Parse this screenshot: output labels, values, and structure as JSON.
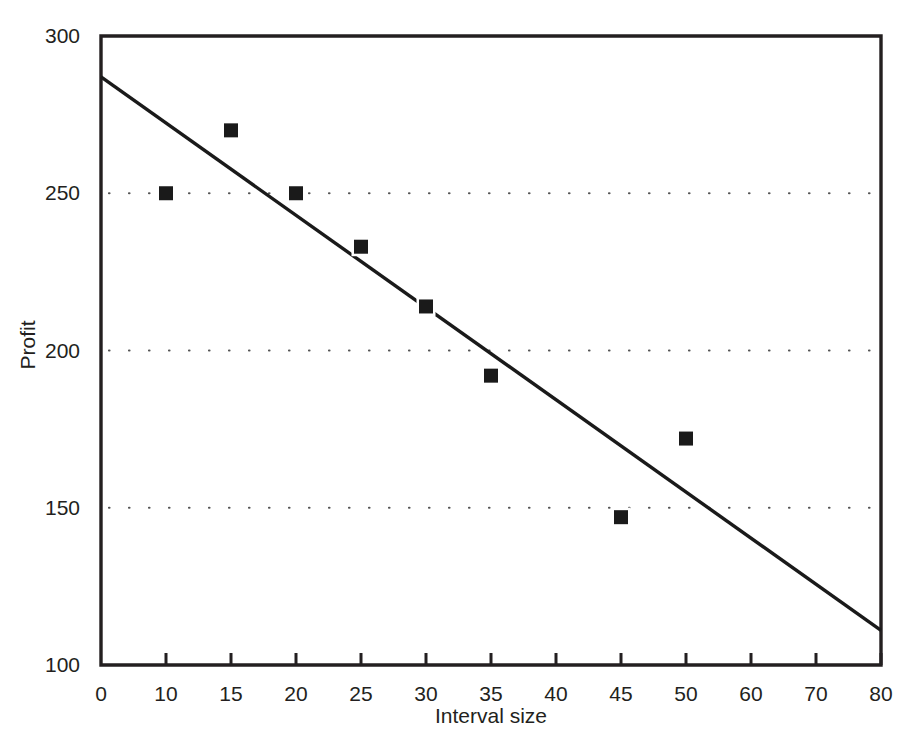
{
  "chart_data": {
    "type": "scatter",
    "title": "",
    "xlabel": "Interval size",
    "ylabel": "Profit",
    "x_tick_labels": [
      "0",
      "10",
      "15",
      "20",
      "25",
      "30",
      "35",
      "40",
      "45",
      "50",
      "60",
      "70",
      "80"
    ],
    "y_tick_labels": [
      "100",
      "150",
      "200",
      "250",
      "300"
    ],
    "ylim": [
      100,
      300
    ],
    "y_gridlines": [
      150,
      200,
      250
    ],
    "grid": "dotted-horizontal",
    "legend": "none",
    "x_axis_scale": "ordinal-evenly-spaced",
    "points": [
      {
        "x": 10,
        "y": 250
      },
      {
        "x": 15,
        "y": 270
      },
      {
        "x": 20,
        "y": 250
      },
      {
        "x": 25,
        "y": 233
      },
      {
        "x": 30,
        "y": 214
      },
      {
        "x": 35,
        "y": 192
      },
      {
        "x": 45,
        "y": 147
      },
      {
        "x": 50,
        "y": 172
      }
    ],
    "series": [
      {
        "name": "Profit observations",
        "type": "scatter",
        "marker": "filled-square",
        "color": "#1a1a1a",
        "x": [
          10,
          15,
          20,
          25,
          30,
          35,
          45,
          50
        ],
        "values": [
          250,
          270,
          250,
          233,
          214,
          192,
          147,
          172
        ]
      },
      {
        "name": "Fitted line",
        "type": "line",
        "color": "#1a1a1a",
        "x": [
          0,
          80
        ],
        "values": [
          287,
          111
        ]
      }
    ],
    "trendline": {
      "x_start": 0,
      "y_start": 287,
      "x_end": 80,
      "y_end": 111
    }
  },
  "colors": {
    "axis": "#231f20",
    "marker": "#1a1a1a",
    "line": "#1a1a1a",
    "grid_dot": "#555555",
    "background": "#ffffff"
  }
}
